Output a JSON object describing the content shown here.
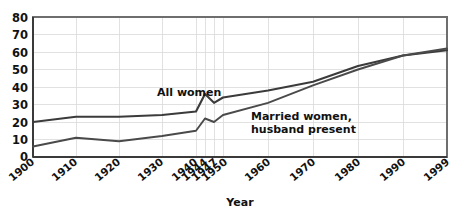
{
  "chart_data": {
    "type": "line",
    "title": "",
    "xlabel": "Year",
    "ylabel": "",
    "ylim": [
      0,
      80
    ],
    "yticks": [
      0,
      10,
      20,
      30,
      40,
      50,
      60,
      70,
      80
    ],
    "grid": true,
    "legend_position": "inline-annotations",
    "categories": [
      "1900",
      "1910",
      "1920",
      "1930",
      "1940",
      "1944",
      "1947",
      "1950",
      "1960",
      "1970",
      "1980",
      "1990",
      "1999"
    ],
    "series": [
      {
        "name": "All women",
        "values": [
          20,
          23,
          23,
          24,
          26,
          36,
          31,
          34,
          38,
          43,
          52,
          58,
          61
        ]
      },
      {
        "name": "Married women, husband present",
        "values": [
          6,
          11,
          9,
          12,
          15,
          22,
          20,
          24,
          31,
          41,
          50,
          58,
          62
        ]
      }
    ],
    "annotations": [
      {
        "text": "All women",
        "series": "All women"
      },
      {
        "text": "Married women,",
        "series": "Married women, husband present"
      },
      {
        "text": "husband present",
        "series": "Married women, husband present"
      }
    ]
  },
  "axis": {
    "x_title": "Year",
    "y_tick_labels": [
      "80",
      "70",
      "60",
      "50",
      "40",
      "30",
      "20",
      "10",
      "0"
    ],
    "x_tick_labels": [
      "1900",
      "1910",
      "1920",
      "1930",
      "1940",
      "1944",
      "1947",
      "1950",
      "1960",
      "1970",
      "1980",
      "1990",
      "1999"
    ]
  },
  "labels": {
    "all_women": "All women",
    "married_women_line1": "Married women,",
    "married_women_line2": "husband present"
  },
  "colors": {
    "series_line": "#3b3b3b",
    "gridline": "#d9d9d9",
    "frame": "#6e6e6e",
    "text": "#111111",
    "background": "#ffffff"
  }
}
